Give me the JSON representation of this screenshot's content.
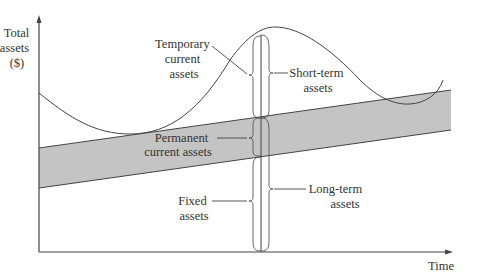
{
  "diagram": {
    "y_axis_label": [
      "Total",
      "assets",
      "($)"
    ],
    "x_axis_label": "Time",
    "labels": {
      "temporary_current_assets": [
        "Temporary",
        "current",
        "assets"
      ],
      "short_term_assets": [
        "Short-term",
        "assets"
      ],
      "permanent_current_assets": [
        "Permanent",
        "current assets"
      ],
      "fixed_assets": [
        "Fixed",
        "assets"
      ],
      "long_term_assets": [
        "Long-term",
        "assets"
      ]
    },
    "colors": {
      "band_fill": "#c4c4c4",
      "line": "#444444",
      "text": "#333333"
    }
  }
}
